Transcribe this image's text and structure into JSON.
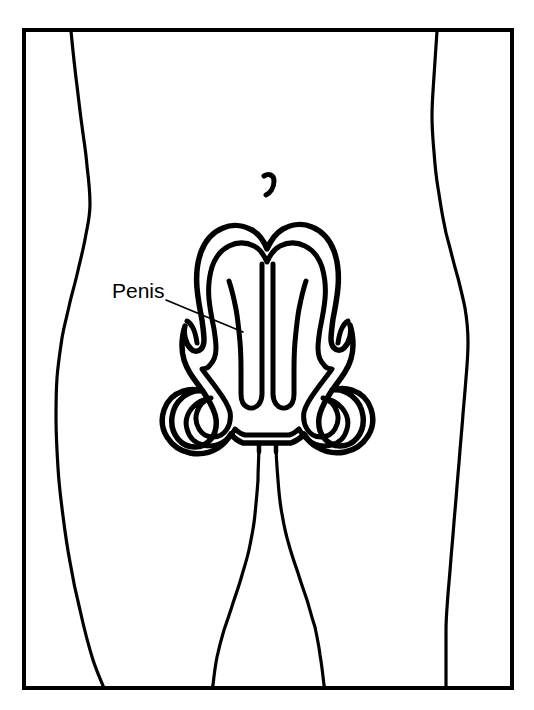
{
  "figure": {
    "type": "anatomical-line-diagram",
    "background_color": "#ffffff",
    "line_color": "#000000",
    "frame": {
      "name": "figure-border",
      "x": 24,
      "y": 30,
      "width": 488,
      "height": 658,
      "stroke_width": 4
    },
    "labels": [
      {
        "id": "penis",
        "text": "Penis",
        "x": 112,
        "y": 298,
        "font_size": 21,
        "leader": {
          "from_x": 166,
          "from_y": 300,
          "to_x": 243,
          "to_y": 332,
          "stroke_width": 1.6
        }
      }
    ],
    "features": [
      {
        "id": "navel",
        "name": "umbilicus",
        "x": 268,
        "y": 182
      },
      {
        "id": "left-torso-contour",
        "name": "left body outline"
      },
      {
        "id": "right-torso-contour",
        "name": "right body outline"
      },
      {
        "id": "left-inner-leg",
        "name": "left inner thigh outline"
      },
      {
        "id": "right-inner-leg",
        "name": "right inner thigh outline"
      },
      {
        "id": "organ-outer",
        "name": "genital outer contour"
      },
      {
        "id": "organ-inner-left",
        "name": "left inner tubular structure"
      },
      {
        "id": "organ-inner-right",
        "name": "right inner tubular structure"
      },
      {
        "id": "organ-left-fold",
        "name": "left lateral fold"
      },
      {
        "id": "organ-right-fold",
        "name": "right lateral fold"
      }
    ],
    "stroke_widths": {
      "frame": 4,
      "body": 3.2,
      "organ_outer": 5.5,
      "organ_inner": 5,
      "navel": 5,
      "leader": 1.6
    }
  }
}
